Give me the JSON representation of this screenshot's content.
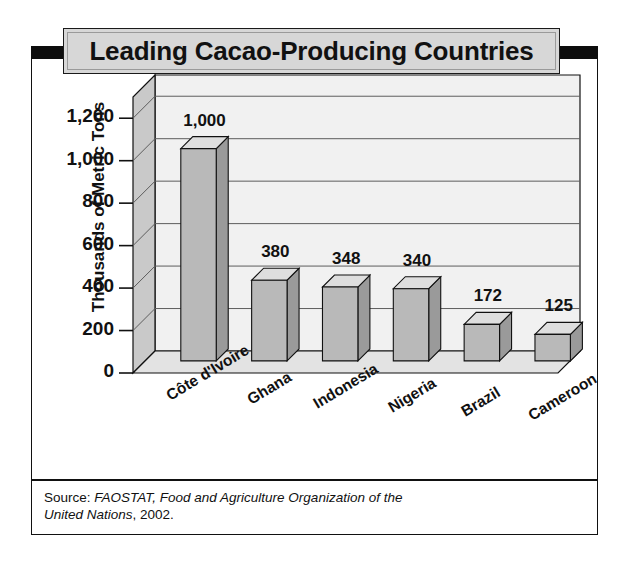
{
  "title": "Leading Cacao-Producing Countries",
  "source": {
    "prefix": "Source: ",
    "italic": "FAOSTAT, Food and Agriculture Organization of the United Nations",
    "suffix": ", 2002."
  },
  "colors": {
    "title_bar": "#0d0d0d",
    "title_box": "#d7d7d7",
    "bar_front": "#b9b9b9",
    "bar_top": "#dedede",
    "bar_side": "#9a9a9a",
    "wall_back": "#f1f1f1",
    "wall_left": "#c9c9c9",
    "floor": "#e3e3e3",
    "outline": "#111111"
  },
  "chart_data": {
    "type": "bar",
    "title": "Leading Cacao-Producing Countries",
    "xlabel": "",
    "ylabel": "Thousands of Metric Tons",
    "categories": [
      "Côte d'Ivoire",
      "Ghana",
      "Indonesia",
      "Nigeria",
      "Brazil",
      "Cameroon"
    ],
    "values": [
      1000,
      380,
      348,
      340,
      172,
      125
    ],
    "value_labels": [
      "1,000",
      "380",
      "348",
      "340",
      "172",
      "125"
    ],
    "ylim": [
      0,
      1300
    ],
    "yticks": [
      0,
      200,
      400,
      600,
      800,
      1000,
      1200
    ],
    "ytick_labels": [
      "0",
      "200",
      "400",
      "600",
      "800",
      "1,000",
      "1,200"
    ],
    "grid": true,
    "legend": "none",
    "style": "3d-column",
    "units": "thousands of metric tons",
    "source": "FAOSTAT, Food and Agriculture Organization of the United Nations, 2002."
  }
}
